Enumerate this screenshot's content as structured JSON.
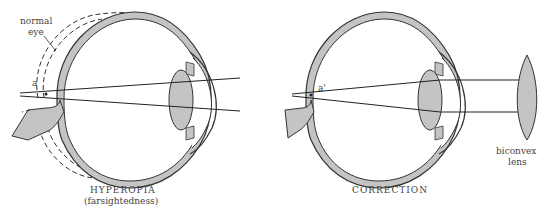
{
  "diagram": {
    "left": {
      "title": "HYPEROPIA",
      "subtitle": "(farsightedness)",
      "normal_eye_label_line1": "normal",
      "normal_eye_label_line2": "eye",
      "focus_point_label": "a"
    },
    "right": {
      "title": "CORRECTION",
      "focus_point_label": "a'",
      "lens_label_line1": "biconvex",
      "lens_label_line2": "lens"
    },
    "colors": {
      "tissue": "#c4c4c4",
      "outline": "#333333",
      "background": "#ffffff"
    }
  }
}
